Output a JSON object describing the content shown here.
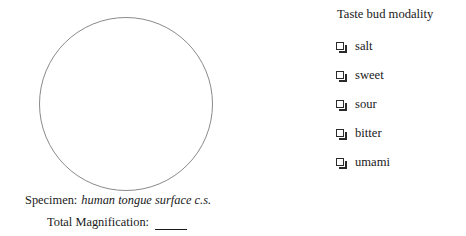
{
  "page": {
    "background_color": "#ffffff",
    "text_color": "#1a1a1a"
  },
  "specimen_panel": {
    "circle": {
      "icon_name": "drawing-circle",
      "stroke_color": "#8a8a8a",
      "diameter_px": 174
    },
    "specimen_label": "Specimen:",
    "specimen_value": "human tongue surface c.s.",
    "magnification_label": "Total Magnification:",
    "magnification_value": ""
  },
  "modality_panel": {
    "title": "Taste bud modality",
    "items": [
      {
        "label": "salt",
        "checkbox_icon": "empty-checkbox-icon",
        "checked": false
      },
      {
        "label": "sweet",
        "checkbox_icon": "empty-checkbox-icon",
        "checked": false
      },
      {
        "label": "sour",
        "checkbox_icon": "empty-checkbox-icon",
        "checked": false
      },
      {
        "label": "bitter",
        "checkbox_icon": "empty-checkbox-icon",
        "checked": false
      },
      {
        "label": "umami",
        "checkbox_icon": "empty-checkbox-icon",
        "checked": false
      }
    ]
  }
}
